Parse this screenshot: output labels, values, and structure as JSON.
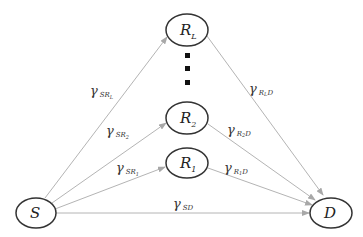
{
  "diagram": {
    "type": "relay network",
    "nodes": {
      "source": {
        "main": "S",
        "sub": ""
      },
      "destination": {
        "main": "D",
        "sub": ""
      },
      "relay_L": {
        "main": "R",
        "sub": "L"
      },
      "relay_2": {
        "main": "R",
        "sub": "2"
      },
      "relay_1": {
        "main": "R",
        "sub": "1"
      }
    },
    "ellipsis": "vertical dots",
    "edges": {
      "s_rl": {
        "main": "γ",
        "sub": "SR",
        "subsub": "L"
      },
      "s_r2": {
        "main": "γ",
        "sub": "SR",
        "subsub": "2"
      },
      "s_r1": {
        "main": "γ",
        "sub": "SR",
        "subsub": "1"
      },
      "s_d": {
        "main": "γ",
        "sub": "SD",
        "subsub": ""
      },
      "rl_d": {
        "main": "γ",
        "sub": "R",
        "subsub": "L",
        "tail": "D"
      },
      "r2_d": {
        "main": "γ",
        "sub": "R",
        "subsub": "2",
        "tail": "D"
      },
      "r1_d": {
        "main": "γ",
        "sub": "R",
        "subsub": "1",
        "tail": "D"
      }
    },
    "colors": {
      "edge": "#b0b0b0",
      "node_stroke": "#333333",
      "text": "#222222"
    }
  }
}
